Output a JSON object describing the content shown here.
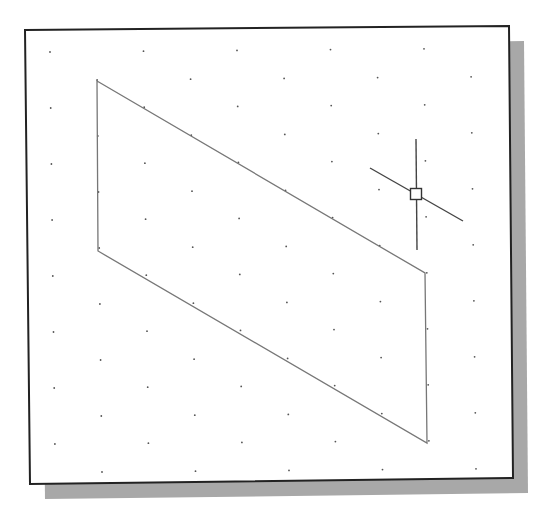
{
  "viewport": {
    "background": "#ffffff",
    "frame": {
      "corners": [
        [
          25,
          30
        ],
        [
          509,
          26
        ],
        [
          513,
          478
        ],
        [
          30,
          484
        ]
      ],
      "border_color": "#222222",
      "shadow_color": "#a8a8a8",
      "shadow_offset": [
        15,
        15
      ]
    },
    "grid": {
      "type": "isometric-snap-grid",
      "dot_color": "#555555",
      "origin": [
        50,
        52
      ],
      "spacing_x": 93.5,
      "spacing_y": 56,
      "rows": 8,
      "cols": 5
    },
    "shape": {
      "name": "parallelogram",
      "points": [
        [
          97,
          81
        ],
        [
          425,
          273
        ],
        [
          427,
          443
        ],
        [
          98,
          251
        ]
      ],
      "stroke": "#777777"
    },
    "cursor": {
      "name": "isometric-crosshair-cursor",
      "center": [
        416,
        194
      ],
      "box_size": 11,
      "vertical": [
        [
          416,
          139
        ],
        [
          417,
          250
        ]
      ],
      "iso_line": [
        [
          370,
          168
        ],
        [
          463,
          221
        ]
      ],
      "stroke": "#444444"
    }
  }
}
